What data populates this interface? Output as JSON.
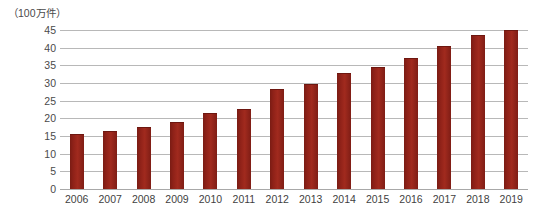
{
  "chart_data": {
    "type": "bar",
    "title": "",
    "subtitle": "",
    "xlabel": "",
    "ylabel": "（100万件）",
    "unit_label": "（100万件）",
    "categories": [
      "2006",
      "2007",
      "2008",
      "2009",
      "2010",
      "2011",
      "2012",
      "2013",
      "2014",
      "2015",
      "2016",
      "2017",
      "2018",
      "2019"
    ],
    "values": [
      15.2,
      16.2,
      17.4,
      18.8,
      21.2,
      22.5,
      28.0,
      29.4,
      32.5,
      34.2,
      36.8,
      40.2,
      43.3,
      44.8
    ],
    "ylim": [
      0,
      45
    ],
    "ytick_step": 5,
    "ytick_labels": [
      "45",
      "40",
      "35",
      "30",
      "25",
      "20",
      "15",
      "10",
      "5",
      "0"
    ],
    "ytick_values": [
      45,
      40,
      35,
      30,
      25,
      20,
      15,
      10,
      5,
      0
    ],
    "grid": true,
    "legend": false,
    "legend_position": "none",
    "series": [
      {
        "name": "",
        "color": "#8e2118",
        "values": [
          15.2,
          16.2,
          17.4,
          18.8,
          21.2,
          22.5,
          28.0,
          29.4,
          32.5,
          34.2,
          36.8,
          40.2,
          43.3,
          44.8
        ]
      }
    ],
    "colors": {
      "bar": "#8e2118",
      "grid": "#b8b8b8",
      "text": "#4a4a4a",
      "background": "#ffffff"
    }
  }
}
